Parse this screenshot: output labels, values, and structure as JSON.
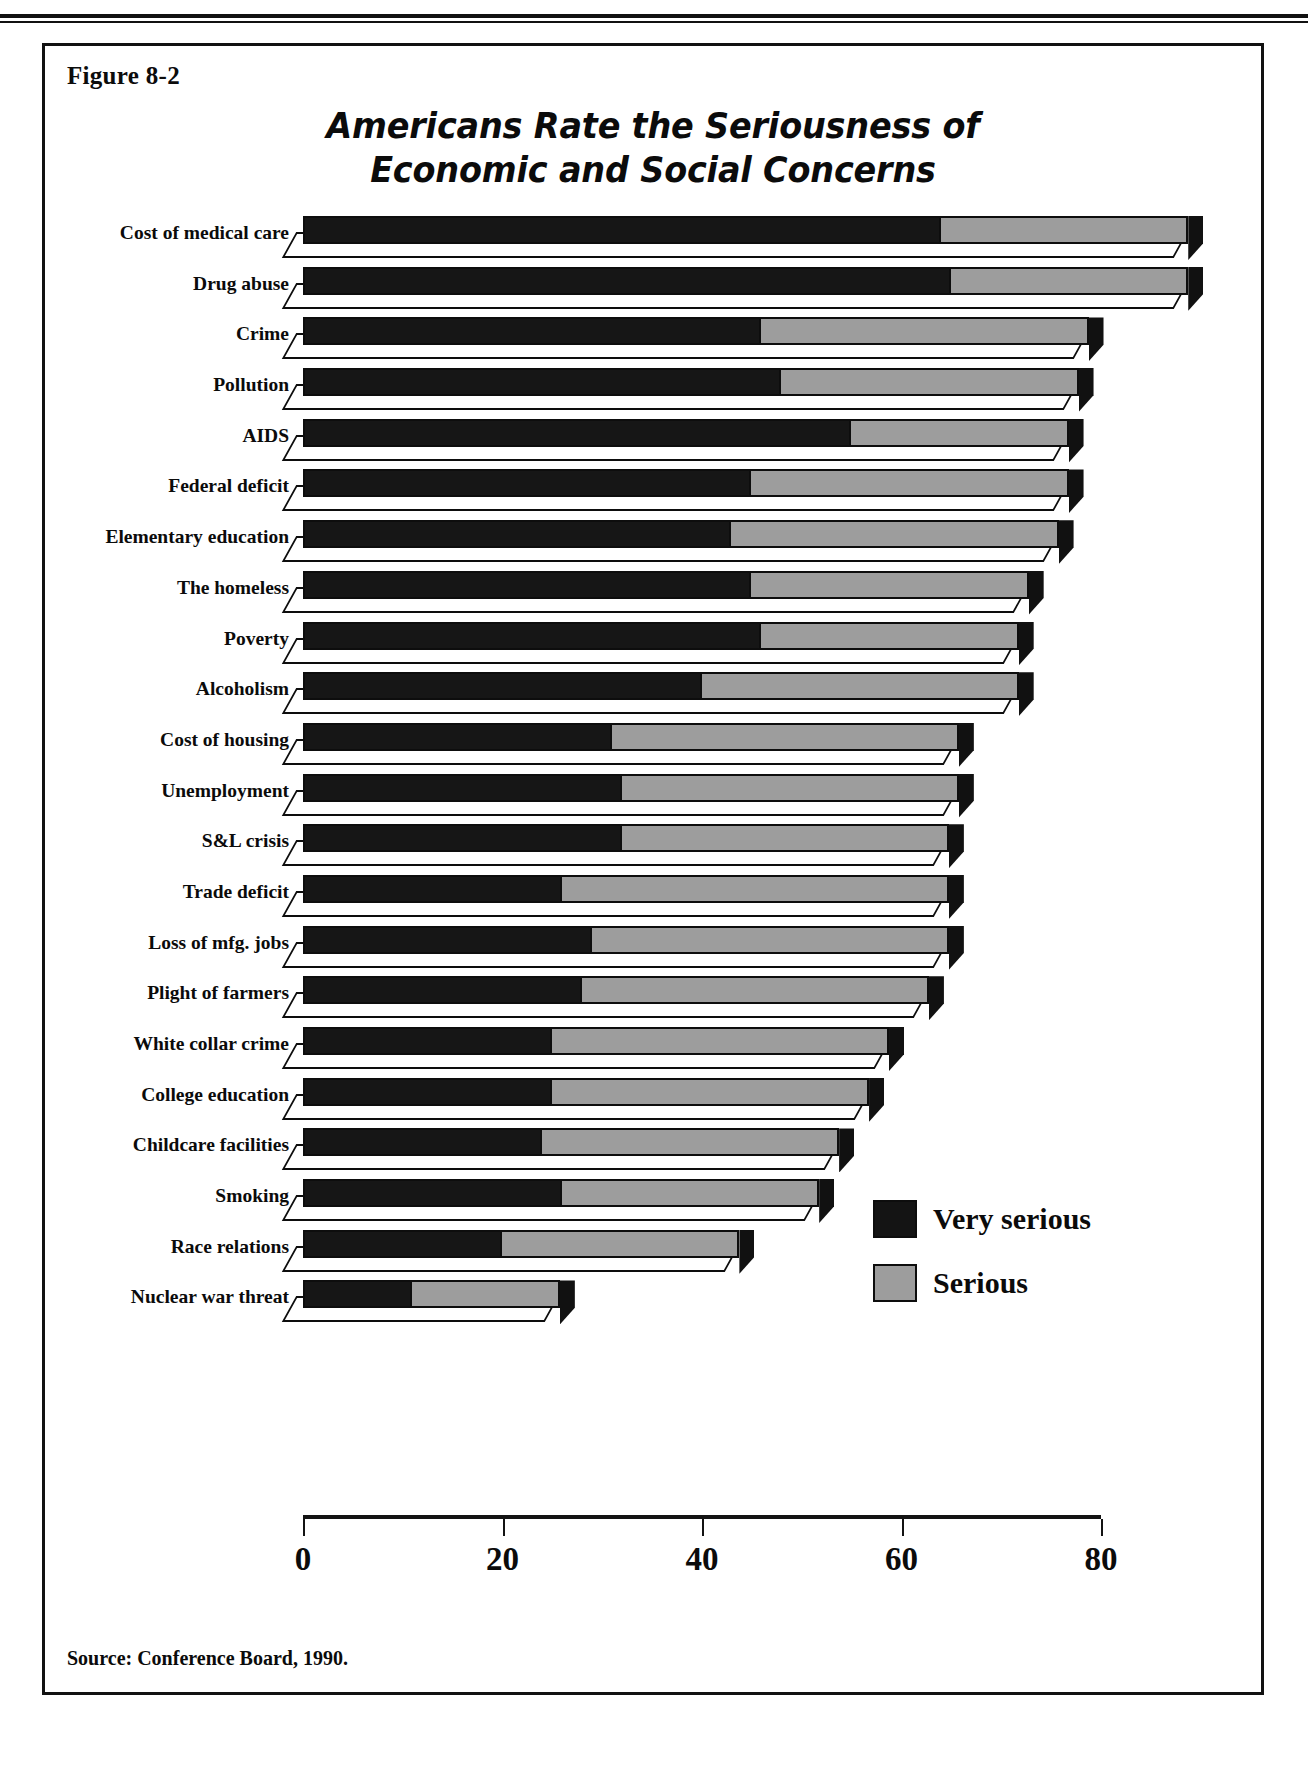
{
  "figure": {
    "label": "Figure 8-2",
    "source": "Source: Conference Board, 1990."
  },
  "chart_data": {
    "type": "bar",
    "orientation": "horizontal",
    "stacked": true,
    "style": "3d-isometric",
    "title": "Americans Rate the Seriousness of Economic and Social Concerns",
    "title_line1": "Americans Rate the Seriousness of",
    "title_line2": "Economic and Social Concerns",
    "xlabel": "",
    "ylabel": "",
    "xlim": [
      0,
      90
    ],
    "xticks": [
      0,
      20,
      40,
      60,
      80
    ],
    "xticklabels": [
      "0",
      "20",
      "40",
      "60",
      "80"
    ],
    "grid": false,
    "legend_position": "lower-right-inside",
    "colors": {
      "very_serious": "#141414",
      "serious": "#9d9d9d",
      "axis": "#131313",
      "outline": "#0d0d0d"
    },
    "categories": [
      "Cost of medical care",
      "Drug abuse",
      "Crime",
      "Pollution",
      "AIDS",
      "Federal deficit",
      "Elementary education",
      "The homeless",
      "Poverty",
      "Alcoholism",
      "Cost of housing",
      "Unemployment",
      "S&L crisis",
      "Trade deficit",
      "Loss of mfg. jobs",
      "Plight of farmers",
      "White collar crime",
      "College education",
      "Childcare facilities",
      "Smoking",
      "Race relations",
      "Nuclear war threat"
    ],
    "series": [
      {
        "name": "Very serious",
        "color": "#141414",
        "values": [
          64,
          65,
          46,
          48,
          55,
          45,
          43,
          45,
          46,
          40,
          31,
          32,
          32,
          26,
          29,
          28,
          25,
          25,
          24,
          26,
          20,
          11
        ]
      },
      {
        "name": "Serious",
        "color": "#9d9d9d",
        "values": [
          25,
          24,
          33,
          30,
          22,
          32,
          33,
          28,
          26,
          32,
          35,
          34,
          33,
          39,
          36,
          35,
          34,
          32,
          30,
          26,
          24,
          15
        ]
      }
    ],
    "totals": [
      89,
      89,
      79,
      78,
      77,
      77,
      76,
      73,
      72,
      72,
      66,
      66,
      65,
      65,
      65,
      63,
      59,
      57,
      54,
      52,
      44,
      26
    ]
  },
  "legend": {
    "items": [
      {
        "label": "Very serious",
        "swatch": "very"
      },
      {
        "label": "Serious",
        "swatch": "ser"
      }
    ]
  }
}
